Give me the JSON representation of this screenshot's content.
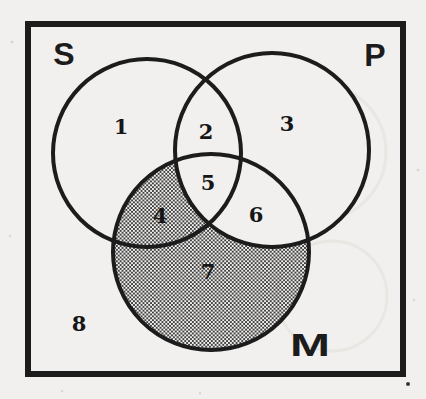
{
  "colors": {
    "paper": "#f1f0ee",
    "ink": "#1c1c1c",
    "shading_dot": "#424242",
    "ghost": "#e4e2dd"
  },
  "sets": [
    {
      "label": "S"
    },
    {
      "label": "P"
    },
    {
      "label": "M"
    }
  ],
  "regions": [
    {
      "label": "1",
      "shaded": false
    },
    {
      "label": "2",
      "shaded": false
    },
    {
      "label": "3",
      "shaded": false
    },
    {
      "label": "4",
      "shaded": true
    },
    {
      "label": "5",
      "shaded": false
    },
    {
      "label": "6",
      "shaded": false
    },
    {
      "label": "7",
      "shaded": true
    },
    {
      "label": "8",
      "shaded": false
    }
  ],
  "shading": {
    "style": "halftone-dots",
    "covers_regions": [
      "4",
      "7"
    ]
  }
}
